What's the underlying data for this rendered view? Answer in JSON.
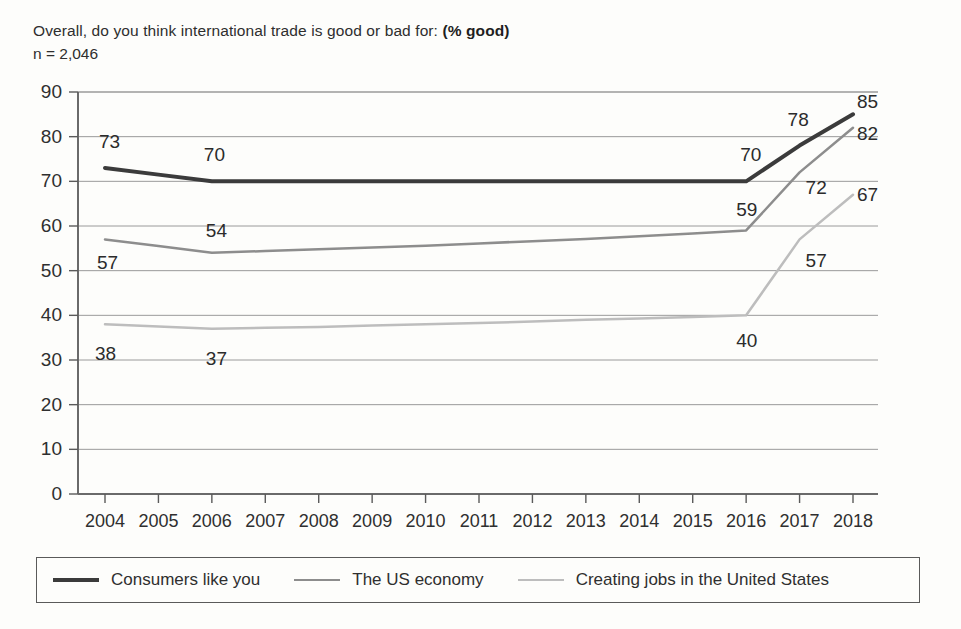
{
  "header": {
    "question": "Overall, do you think international trade is good or bad for:",
    "metric": "(% good)",
    "sample_size": "n = 2,046"
  },
  "chart_data": {
    "type": "line",
    "title": "Overall, do you think international trade is good or bad for: (% good)",
    "subtitle": "n = 2,046",
    "xlabel": "",
    "ylabel": "",
    "ylim": [
      0,
      90
    ],
    "ytick_step": 10,
    "grid": true,
    "legend_position": "bottom",
    "categories": [
      "2004",
      "2005",
      "2006",
      "2007",
      "2008",
      "2009",
      "2010",
      "2011",
      "2012",
      "2013",
      "2014",
      "2015",
      "2016",
      "2017",
      "2018"
    ],
    "yticks": [
      "0",
      "10",
      "20",
      "30",
      "40",
      "50",
      "60",
      "70",
      "80",
      "90"
    ],
    "series": [
      {
        "name": "Consumers like you",
        "color": "#3b3b3b",
        "width": 4,
        "values": [
          73,
          71.5,
          70,
          70,
          70,
          70,
          70,
          70,
          70,
          70,
          70,
          70,
          70,
          78,
          85
        ],
        "labels": [
          {
            "index": 0,
            "text": "73",
            "dx": -6,
            "dy": -26,
            "anchor": "start"
          },
          {
            "index": 2,
            "text": "70",
            "dx": -8,
            "dy": -26,
            "anchor": "start"
          },
          {
            "index": 12,
            "text": "70",
            "dx": -6,
            "dy": -26,
            "anchor": "start"
          },
          {
            "index": 13,
            "text": "78",
            "dx": -12,
            "dy": -26,
            "anchor": "start"
          },
          {
            "index": 14,
            "text": "85",
            "dx": 4,
            "dy": -12,
            "anchor": "start"
          }
        ]
      },
      {
        "name": "The US economy",
        "color": "#8d8d8d",
        "width": 2.5,
        "values": [
          57,
          55.5,
          54,
          54.4,
          54.8,
          55.2,
          55.6,
          56.1,
          56.6,
          57.1,
          57.7,
          58.3,
          59,
          72,
          82
        ],
        "labels": [
          {
            "index": 0,
            "text": "57",
            "dx": -8,
            "dy": 24,
            "anchor": "start"
          },
          {
            "index": 2,
            "text": "54",
            "dx": -6,
            "dy": -22,
            "anchor": "start"
          },
          {
            "index": 12,
            "text": "59",
            "dx": -10,
            "dy": -20,
            "anchor": "start"
          },
          {
            "index": 13,
            "text": "72",
            "dx": 6,
            "dy": 16,
            "anchor": "start"
          },
          {
            "index": 14,
            "text": "82",
            "dx": 4,
            "dy": 6,
            "anchor": "start"
          }
        ]
      },
      {
        "name": "Creating jobs in the United States",
        "color": "#bdbdbd",
        "width": 2.5,
        "values": [
          38,
          37.5,
          37,
          37.2,
          37.4,
          37.7,
          38,
          38.3,
          38.6,
          39,
          39.3,
          39.6,
          40,
          57,
          67
        ],
        "labels": [
          {
            "index": 0,
            "text": "38",
            "dx": -10,
            "dy": 30,
            "anchor": "start"
          },
          {
            "index": 2,
            "text": "37",
            "dx": -6,
            "dy": 30,
            "anchor": "start"
          },
          {
            "index": 12,
            "text": "40",
            "dx": -10,
            "dy": 26,
            "anchor": "start"
          },
          {
            "index": 13,
            "text": "57",
            "dx": 6,
            "dy": 22,
            "anchor": "start"
          },
          {
            "index": 14,
            "text": "67",
            "dx": 4,
            "dy": 0,
            "anchor": "start"
          }
        ]
      }
    ]
  },
  "legend": {
    "items": [
      {
        "label": "Consumers like you",
        "style": "sw-dark"
      },
      {
        "label": "The US economy",
        "style": "sw-mid"
      },
      {
        "label": "Creating jobs in the United States",
        "style": "sw-light"
      }
    ]
  }
}
